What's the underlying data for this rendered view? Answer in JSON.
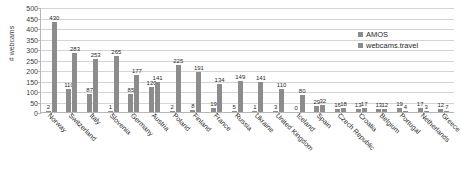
{
  "chart_data": {
    "type": "bar",
    "title": "",
    "xlabel": "",
    "ylabel": "# webcams",
    "ylim": [
      0,
      500
    ],
    "yticks": [
      0,
      50,
      100,
      150,
      200,
      250,
      300,
      350,
      400,
      450,
      500
    ],
    "grid": true,
    "legend_position": "top-right",
    "categories": [
      "Norway",
      "Switzerland",
      "Italy",
      "Slovenia",
      "Germany",
      "Austria",
      "Poland",
      "Finland",
      "France",
      "Russia",
      "Ukraine",
      "United Kingdom",
      "Iceland",
      "Spain",
      "Czech Republic",
      "Croatia",
      "Belgium",
      "Portugal",
      "Netherlands",
      "Greece"
    ],
    "series": [
      {
        "name": "AMOS",
        "color": "#8c8c8c",
        "values": [
          2,
          110,
          87,
          1,
          85,
          120,
          2,
          8,
          19,
          5,
          1,
          3,
          0,
          29,
          16,
          13,
          13,
          19,
          17,
          12
        ]
      },
      {
        "name": "webcams.travel",
        "color": "#8c8c8c",
        "values": [
          430,
          283,
          253,
          265,
          177,
          141,
          225,
          191,
          134,
          149,
          141,
          110,
          80,
          32,
          18,
          17,
          12,
          4,
          3,
          7
        ]
      }
    ]
  },
  "legend": {
    "entries": [
      {
        "label": "AMOS"
      },
      {
        "label": "webcams.travel"
      }
    ]
  },
  "axis": {
    "y_title": "# webcams"
  }
}
